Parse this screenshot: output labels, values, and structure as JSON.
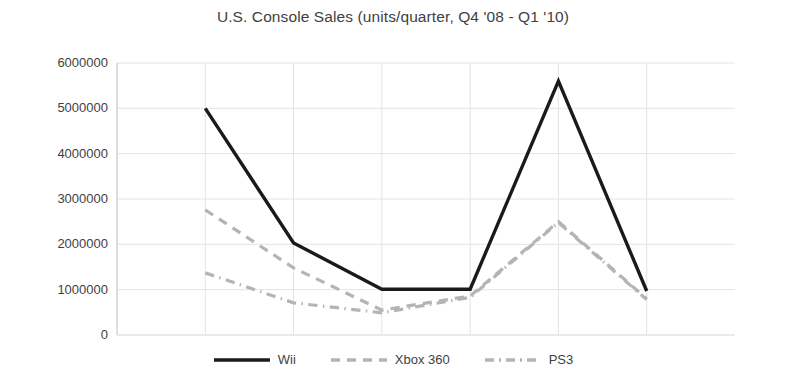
{
  "chart_data": {
    "type": "line",
    "title": "U.S. Console Sales (units/quarter, Q4 '08 - Q1 '10)",
    "xlabel": "",
    "ylabel": "",
    "x": [
      "Q4 '08",
      "Q1 '09",
      "Q2 '09",
      "Q3 '09",
      "Q4 '09",
      "Q1 '10"
    ],
    "categories": [
      "Q4 '08",
      "Q1 '09",
      "Q2 '09",
      "Q3 '09",
      "Q4 '09",
      "Q1 '10"
    ],
    "ylim": [
      0,
      6000000
    ],
    "ytick_labels": [
      "6000000",
      "5000000",
      "4000000",
      "3000000",
      "2000000",
      "1000000",
      "0"
    ],
    "ytick_values": [
      6000000,
      5000000,
      4000000,
      3000000,
      2000000,
      1000000,
      0
    ],
    "xtick_labels": [],
    "grid": true,
    "grid_axis": "both",
    "grid_color": "#e2e2e2",
    "legend_position": "bottom",
    "series": [
      {
        "name": "Wii",
        "values": [
          5000000,
          2030000,
          1010000,
          1010000,
          5600000,
          970000
        ],
        "color": "#1a1a1a",
        "style": "solid",
        "width": 3.4
      },
      {
        "name": "Xbox 360",
        "values": [
          2760000,
          1480000,
          550000,
          860000,
          2500000,
          800000
        ],
        "color": "#b4b4b4",
        "style": "dashed",
        "width": 3.2
      },
      {
        "name": "PS3",
        "values": [
          1370000,
          710000,
          490000,
          830000,
          2480000,
          780000
        ],
        "color": "#b4b4b4",
        "style": "dashdot",
        "width": 3.2
      }
    ]
  },
  "colors": {
    "background": "#ffffff",
    "text": "#3f3f3f",
    "axis": "#d0d0d0",
    "grid": "#e4e4e4",
    "wii": "#1a1a1a",
    "xbox": "#b4b4b4",
    "ps3": "#b4b4b4"
  }
}
